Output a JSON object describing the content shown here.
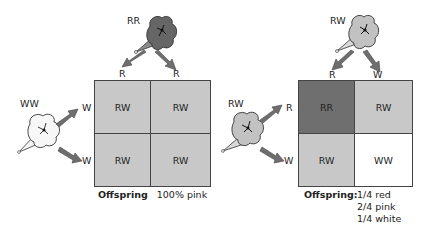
{
  "colors": {
    "red": "#6f6f6f",
    "pink": "#c8c8c8",
    "white": "#ffffff",
    "arrow": "#6e6e6e",
    "grid_border": "#444444"
  },
  "left_cross": {
    "top_parent": {
      "genotype": "RR",
      "color": "red",
      "gametes": [
        "R",
        "R"
      ]
    },
    "side_parent": {
      "genotype": "WW",
      "color": "white",
      "gametes": [
        "W",
        "W"
      ]
    },
    "punnett": [
      [
        {
          "genotype": "RW",
          "color": "pink"
        },
        {
          "genotype": "RW",
          "color": "pink"
        }
      ],
      [
        {
          "genotype": "RW",
          "color": "pink"
        },
        {
          "genotype": "RW",
          "color": "pink"
        }
      ]
    ],
    "caption": {
      "label": "Offspring",
      "text": "100% pink"
    }
  },
  "right_cross": {
    "top_parent": {
      "genotype": "RW",
      "color": "pink",
      "gametes": [
        "R",
        "W"
      ]
    },
    "side_parent": {
      "genotype": "RW",
      "color": "pink",
      "gametes": [
        "R",
        "W"
      ]
    },
    "punnett": [
      [
        {
          "genotype": "RR",
          "color": "red"
        },
        {
          "genotype": "RW",
          "color": "pink"
        }
      ],
      [
        {
          "genotype": "RW",
          "color": "pink"
        },
        {
          "genotype": "WW",
          "color": "white"
        }
      ]
    ],
    "caption": {
      "label": "Offspring:",
      "lines": [
        "1/4 red",
        "2/4 pink",
        "1/4 white"
      ]
    }
  }
}
